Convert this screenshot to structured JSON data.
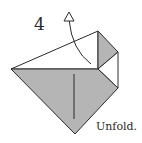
{
  "step": {
    "number": "4",
    "caption": "Unfold."
  },
  "colors": {
    "paper_colored": "#b5b5b5",
    "paper_white": "#ffffff",
    "line": "#2a2a2a"
  }
}
